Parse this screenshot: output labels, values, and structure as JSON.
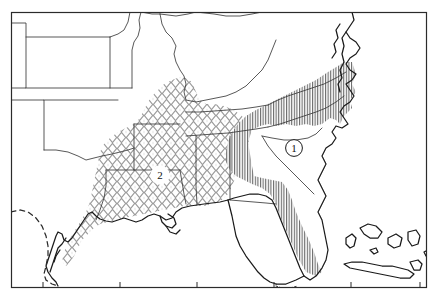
{
  "figure": {
    "type": "distribution-map",
    "region_described": "Southeastern United States",
    "caption_faint": "",
    "frame": {
      "x": 11,
      "y": 12,
      "width": 416,
      "height": 276,
      "stroke": "#2b2b2b"
    }
  },
  "colors": {
    "background": "#ffffff",
    "frame_stroke": "#2b2b2b",
    "coastline_stroke": "#1a1a1a",
    "state_border_stroke": "#3a3a3a",
    "hatch_vertical": "#4a4a4a",
    "hatch_diamond": "#9a9a9a",
    "label_circle_fill": "#ffffff",
    "label_text": "#111111",
    "dashed_border": "#2b2b2b",
    "faint_caption": "#d8d8d8"
  },
  "legend_regions": [
    {
      "id": "region-1",
      "label": "1",
      "pattern": "vertical-lines",
      "pattern_color": "#4a4a4a",
      "label_position": {
        "x": 294,
        "y": 148
      },
      "coverage": "Atlantic and Gulf coastal plain from the Chesapeake south through the Carolinas, Georgia and peninsular Florida"
    },
    {
      "id": "region-2",
      "label": "2",
      "pattern": "diamond-lattice",
      "pattern_color": "#9a9a9a",
      "label_position": {
        "x": 160,
        "y": 175
      },
      "coverage": "Lower Mississippi Valley: east Texas, Louisiana, Mississippi, Arkansas, western Tennessee and Gulf coast"
    }
  ],
  "axis": {
    "bottom_ticks": [
      {
        "x": 43
      },
      {
        "x": 120
      },
      {
        "x": 197
      },
      {
        "x": 274
      },
      {
        "x": 351
      },
      {
        "x": 420
      }
    ]
  },
  "map_features": {
    "dashed_boundary_name": "international border",
    "islands": [
      "Cuba",
      "Bahamas"
    ]
  }
}
